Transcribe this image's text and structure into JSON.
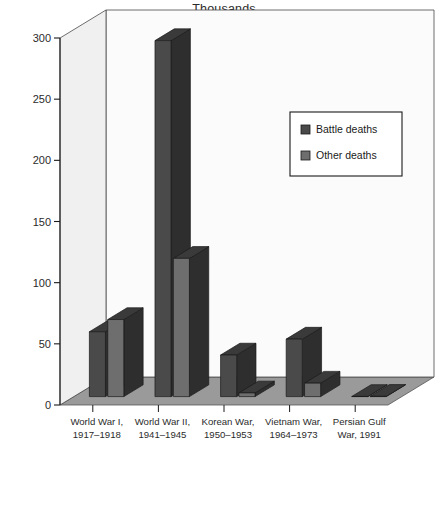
{
  "chart_data": {
    "type": "bar",
    "title": "Thousands",
    "subtitle": "",
    "xlabel": "",
    "ylabel": "",
    "ylim": [
      0,
      300
    ],
    "yticks": [
      0,
      50,
      100,
      150,
      200,
      250,
      300
    ],
    "ytick_labels": [
      "0",
      "50",
      "100",
      "150",
      "200",
      "250",
      "300"
    ],
    "grid": false,
    "three_d": true,
    "legend_position": "upper right",
    "categories": [
      "World War I,\n1917–1918",
      "World War II,\n1941–1945",
      "Korean War,\n1950–1953",
      "Vietnam War,\n1964–1973",
      "Persian Gulf\nWar, 1991"
    ],
    "category_lines": [
      [
        "World War I,",
        "1917–1918"
      ],
      [
        "World War II,",
        "1941–1945"
      ],
      [
        "Korean War,",
        "1950–1953"
      ],
      [
        "Vietnam War,",
        "1964–1973"
      ],
      [
        "Persian Gulf",
        "War, 1991"
      ]
    ],
    "series": [
      {
        "name": "Battle deaths",
        "color": "#4a4a4a",
        "values": [
          53,
          291,
          34,
          47,
          0.1
        ]
      },
      {
        "name": "Other deaths",
        "color": "#6e6e6e",
        "values": [
          63,
          113,
          3,
          11,
          0.2
        ]
      }
    ]
  },
  "legend": {
    "items": [
      {
        "label": "Battle deaths",
        "swatch": "#4a4a4a"
      },
      {
        "label": "Other deaths",
        "swatch": "#6e6e6e"
      }
    ]
  },
  "colors": {
    "background": "#ffffff",
    "wall": "#fbfbfb",
    "wall_side": "#f0f0f0",
    "floor": "#9a9a9a",
    "axis": "#1a1a1a",
    "battle": "#4a4a4a",
    "other": "#6e6e6e",
    "bar_top": "#3a3a3a",
    "bar_side": "#2e2e2e",
    "text": "#2b2b2b"
  }
}
